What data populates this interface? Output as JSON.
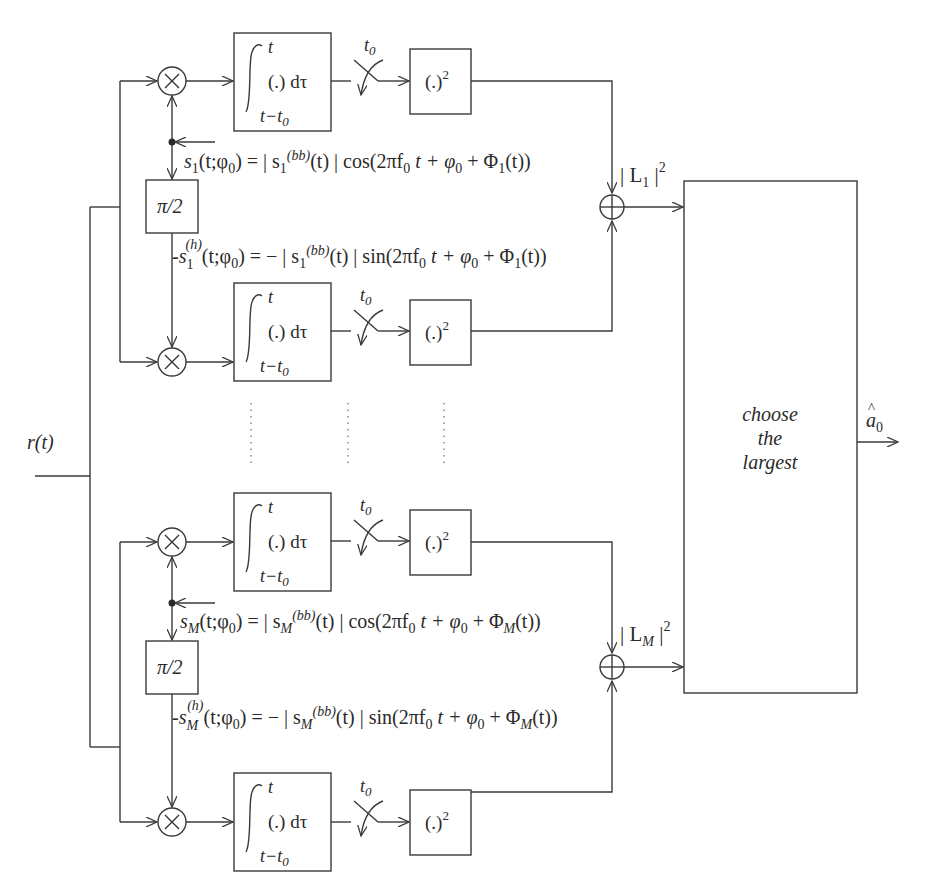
{
  "input": {
    "label": "r(t)"
  },
  "output": {
    "label": "â₀",
    "base": "a",
    "hat": "^",
    "sub": "0"
  },
  "decision": {
    "lines": [
      "choose",
      "the",
      "largest"
    ]
  },
  "integrator": {
    "upper": "t",
    "body": "(.) dτ",
    "lower_a": "t−t",
    "lower_sub": "0"
  },
  "sampler": {
    "label": "t",
    "sub": "0"
  },
  "squarer": {
    "body": "(.)",
    "sup": "2"
  },
  "phase_shift": {
    "label": "π/2"
  },
  "channels": [
    {
      "id": "1",
      "energy": {
        "pre": "| L",
        "sub": "1",
        "post": " |",
        "sup": "2"
      },
      "ref_cos": {
        "lhs": "s",
        "lhs_sub": "1",
        "args": "(t;φ",
        "args_sub": "0",
        "mid": ") = | s",
        "mid_sub": "1",
        "mid_sup": "(bb)",
        "rest": "(t) | cos(2πf",
        "rest_sub": "0",
        "tail": " t + φ",
        "tail_sub": "0",
        "phi": " + Φ",
        "phi_sub": "1",
        "end": "(t))"
      },
      "ref_sin": {
        "lhs": "s",
        "lhs_sub": "1",
        "lhs_sup": "(h)",
        "args": "(t;φ",
        "args_sub": "0",
        "mid": ") = − | s",
        "mid_sub": "1",
        "mid_sup": "(bb)",
        "rest": "(t) | sin(2πf",
        "rest_sub": "0",
        "tail": " t + φ",
        "tail_sub": "0",
        "phi": " + Φ",
        "phi_sub": "1",
        "end": "(t))"
      }
    },
    {
      "id": "M",
      "energy": {
        "pre": "| L",
        "sub": "M",
        "post": " |",
        "sup": "2"
      },
      "ref_cos": {
        "lhs": "s",
        "lhs_sub": "M",
        "args": "(t;φ",
        "args_sub": "0",
        "mid": ") = | s",
        "mid_sub": "M",
        "mid_sup": "(bb)",
        "rest": "(t) | cos(2πf",
        "rest_sub": "0",
        "tail": " t + φ",
        "tail_sub": "0",
        "phi": " + Φ",
        "phi_sub": "M",
        "end": "(t))"
      },
      "ref_sin": {
        "lhs": "s",
        "lhs_sub": "M",
        "lhs_sup": "(h)",
        "args": "(t;φ",
        "args_sub": "0",
        "mid": ") = − | s",
        "mid_sub": "M",
        "mid_sup": "(bb)",
        "rest": "(t) | sin(2πf",
        "rest_sub": "0",
        "tail": " t + φ",
        "tail_sub": "0",
        "phi": " + Φ",
        "phi_sub": "M",
        "end": "(t))"
      }
    }
  ],
  "symbols": {
    "multiplier": "×",
    "adder": "+"
  },
  "colors": {
    "line": "#3a3a3a",
    "text": "#2a2a2a",
    "background": "#ffffff"
  }
}
